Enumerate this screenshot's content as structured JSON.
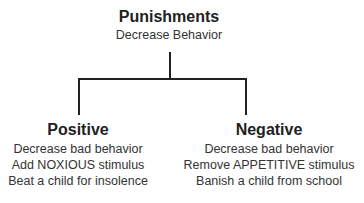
{
  "root": {
    "title": "Punishments",
    "subtitle": "Decrease Behavior"
  },
  "branches": [
    {
      "title": "Positive",
      "lines": [
        "Decrease bad behavior",
        "Add NOXIOUS stimulus",
        "Beat a child for insolence"
      ]
    },
    {
      "title": "Negative",
      "lines": [
        "Decrease bad behavior",
        "Remove APPETITIVE stimulus",
        "Banish a child from school"
      ]
    }
  ]
}
